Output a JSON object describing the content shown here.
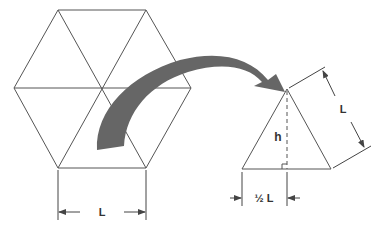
{
  "diagram": {
    "hexagon": {
      "side_label": "L"
    },
    "triangle": {
      "side_label": "L",
      "height_label": "h",
      "half_base_label": "½ L"
    },
    "colors": {
      "line": "#555555",
      "arrow": "#666666",
      "background": "#ffffff"
    }
  }
}
